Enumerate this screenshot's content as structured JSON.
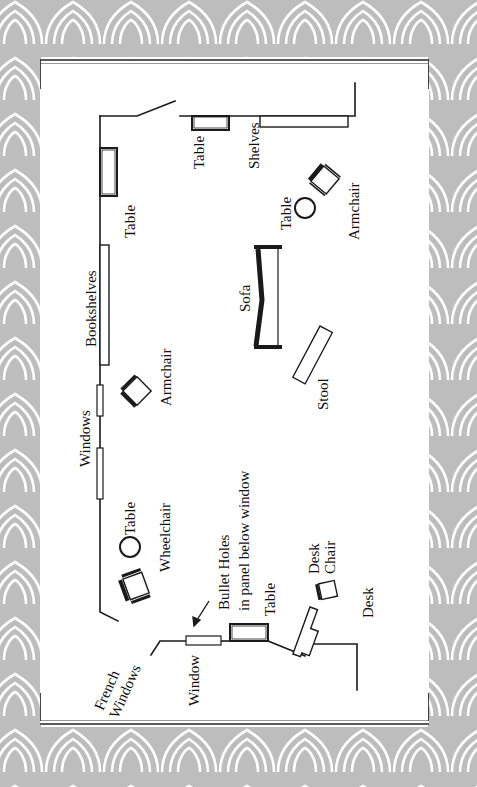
{
  "diagram": {
    "type": "floor_plan",
    "orientation": "rotated 90deg counter-clockwise",
    "colors": {
      "background_pattern": "#bdbdbd",
      "pattern_lines": "#ffffff",
      "card": "#ffffff",
      "ink": "#111111"
    },
    "labels": {
      "table_top_left": "Table",
      "shelves": "Shelves",
      "table_left_wall": "Table",
      "table_round_right": "Table",
      "armchair_right": "Armchair",
      "bookshelves": "Bookshelves",
      "sofa": "Sofa",
      "armchair_left": "Armchair",
      "stool": "Stool",
      "windows": "Windows",
      "table_round_left": "Table",
      "wheelchair": "Wheelchair",
      "bullet_holes_line1": "Bullet Holes",
      "bullet_holes_line2": "in panel below window",
      "table_bottom": "Table",
      "desk_chair_line1": "Desk",
      "desk_chair_line2": "Chair",
      "desk": "Desk",
      "window": "Window",
      "french_windows_line1": "French",
      "french_windows_line2": "Windows"
    }
  }
}
